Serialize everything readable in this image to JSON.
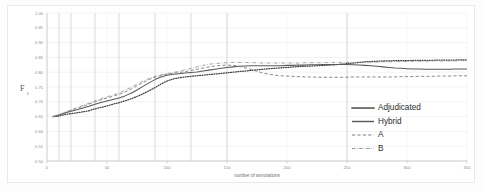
{
  "chart_data": {
    "type": "line",
    "title": "",
    "xlabel": "number of annotations",
    "ylabel": "F",
    "ylabel_sub": "1",
    "xlim": [
      0,
      350
    ],
    "ylim": [
      0.5,
      1.0
    ],
    "grid": true,
    "legend_position": "right-lower",
    "yticks": [
      "1.00",
      "0.95",
      "0.90",
      "0.85",
      "0.80",
      "0.75",
      "0.70",
      "0.65",
      "0.60",
      "0.55",
      "0.50"
    ],
    "ytick_values": [
      1.0,
      0.95,
      0.9,
      0.85,
      0.8,
      0.75,
      0.7,
      0.65,
      0.6,
      0.55,
      0.5
    ],
    "xticks": [
      "0",
      "50",
      "100",
      "150",
      "200",
      "250",
      "300",
      "350"
    ],
    "xtick_values": [
      0,
      50,
      100,
      150,
      200,
      250,
      300,
      350
    ],
    "emphasis_gridlines_x": [
      10,
      20,
      40,
      60,
      90,
      120,
      150,
      250
    ],
    "series": [
      {
        "name": "Adjudicated",
        "style": "dotted",
        "color": "#3f3f3f",
        "x": [
          5,
          10,
          15,
          20,
          25,
          30,
          35,
          40,
          45,
          50,
          55,
          60,
          65,
          70,
          75,
          80,
          85,
          90,
          95,
          100,
          105,
          110,
          115,
          120,
          125,
          130,
          135,
          140,
          145,
          150,
          155,
          160,
          165,
          170,
          175,
          180,
          185,
          190,
          195,
          200,
          205,
          210,
          215,
          220,
          225,
          230,
          235,
          240,
          245,
          250,
          255,
          260,
          265,
          270,
          275,
          280,
          285,
          290,
          295,
          300,
          305,
          310,
          315,
          320,
          325,
          330,
          335,
          340,
          345,
          350
        ],
        "values": [
          0.65,
          0.652,
          0.657,
          0.66,
          0.663,
          0.666,
          0.67,
          0.676,
          0.681,
          0.686,
          0.692,
          0.697,
          0.703,
          0.71,
          0.718,
          0.727,
          0.737,
          0.748,
          0.76,
          0.77,
          0.777,
          0.781,
          0.784,
          0.786,
          0.788,
          0.79,
          0.792,
          0.794,
          0.796,
          0.798,
          0.8,
          0.802,
          0.804,
          0.806,
          0.808,
          0.81,
          0.812,
          0.813,
          0.815,
          0.816,
          0.818,
          0.819,
          0.82,
          0.821,
          0.822,
          0.823,
          0.824,
          0.825,
          0.827,
          0.829,
          0.831,
          0.833,
          0.835,
          0.836,
          0.837,
          0.838,
          0.838,
          0.839,
          0.839,
          0.839,
          0.84,
          0.84,
          0.84,
          0.84,
          0.841,
          0.841,
          0.841,
          0.841,
          0.842,
          0.842
        ]
      },
      {
        "name": "Hybrid",
        "style": "solid",
        "color": "#5a5a5a",
        "x": [
          5,
          10,
          15,
          20,
          25,
          30,
          35,
          40,
          45,
          50,
          55,
          60,
          65,
          70,
          75,
          80,
          85,
          90,
          95,
          100,
          105,
          110,
          115,
          120,
          125,
          130,
          135,
          140,
          145,
          150,
          155,
          160,
          165,
          170,
          175,
          180,
          185,
          190,
          195,
          200,
          205,
          210,
          215,
          220,
          225,
          230,
          235,
          240,
          245,
          250,
          255,
          260,
          265,
          270,
          275,
          280,
          285,
          290,
          295,
          300,
          305,
          310,
          315,
          320,
          325,
          330,
          335,
          340,
          345,
          350
        ],
        "values": [
          0.65,
          0.655,
          0.662,
          0.668,
          0.673,
          0.679,
          0.685,
          0.692,
          0.698,
          0.703,
          0.708,
          0.713,
          0.72,
          0.729,
          0.74,
          0.752,
          0.764,
          0.775,
          0.784,
          0.79,
          0.793,
          0.795,
          0.797,
          0.799,
          0.801,
          0.804,
          0.807,
          0.81,
          0.813,
          0.816,
          0.818,
          0.82,
          0.821,
          0.822,
          0.822,
          0.822,
          0.822,
          0.822,
          0.822,
          0.823,
          0.823,
          0.824,
          0.824,
          0.825,
          0.825,
          0.826,
          0.826,
          0.826,
          0.826,
          0.826,
          0.825,
          0.824,
          0.823,
          0.822,
          0.82,
          0.818,
          0.816,
          0.814,
          0.813,
          0.812,
          0.811,
          0.811,
          0.81,
          0.81,
          0.81,
          0.81,
          0.81,
          0.811,
          0.811,
          0.811
        ]
      },
      {
        "name": "A",
        "style": "dashed",
        "color": "#7d7d7d",
        "x": [
          5,
          10,
          15,
          20,
          25,
          30,
          35,
          40,
          45,
          50,
          55,
          60,
          65,
          70,
          75,
          80,
          85,
          90,
          95,
          100,
          105,
          110,
          115,
          120,
          125,
          130,
          135,
          140,
          145,
          150,
          155,
          160,
          165,
          170,
          175,
          180,
          185,
          190,
          195,
          200,
          205,
          210,
          215,
          220,
          225,
          230,
          235,
          240,
          245,
          250,
          255,
          260,
          265,
          270,
          275,
          280,
          285,
          290,
          295,
          300,
          305,
          310,
          315,
          320,
          325,
          330,
          335,
          340,
          345,
          350
        ],
        "values": [
          0.65,
          0.656,
          0.664,
          0.671,
          0.678,
          0.685,
          0.692,
          0.7,
          0.707,
          0.713,
          0.719,
          0.725,
          0.733,
          0.743,
          0.754,
          0.765,
          0.775,
          0.783,
          0.789,
          0.793,
          0.796,
          0.799,
          0.802,
          0.806,
          0.81,
          0.814,
          0.818,
          0.821,
          0.823,
          0.824,
          0.823,
          0.82,
          0.815,
          0.809,
          0.803,
          0.797,
          0.793,
          0.79,
          0.788,
          0.787,
          0.786,
          0.785,
          0.784,
          0.784,
          0.783,
          0.783,
          0.783,
          0.783,
          0.783,
          0.783,
          0.784,
          0.784,
          0.784,
          0.784,
          0.784,
          0.784,
          0.784,
          0.784,
          0.785,
          0.785,
          0.785,
          0.786,
          0.786,
          0.786,
          0.787,
          0.787,
          0.787,
          0.788,
          0.788,
          0.788
        ]
      },
      {
        "name": "B",
        "style": "dashdot",
        "color": "#949494",
        "x": [
          5,
          10,
          15,
          20,
          25,
          30,
          35,
          40,
          45,
          50,
          55,
          60,
          65,
          70,
          75,
          80,
          85,
          90,
          95,
          100,
          105,
          110,
          115,
          120,
          125,
          130,
          135,
          140,
          145,
          150,
          155,
          160,
          165,
          170,
          175,
          180,
          185,
          190,
          195,
          200,
          205,
          210,
          215,
          220,
          225,
          230,
          235,
          240,
          245,
          250,
          255,
          260,
          265,
          270,
          275,
          280,
          285,
          290,
          295,
          300,
          305,
          310,
          315,
          320,
          325,
          330,
          335,
          340,
          345,
          350
        ],
        "values": [
          0.65,
          0.657,
          0.665,
          0.673,
          0.68,
          0.688,
          0.695,
          0.703,
          0.71,
          0.717,
          0.723,
          0.73,
          0.739,
          0.749,
          0.76,
          0.77,
          0.779,
          0.786,
          0.791,
          0.795,
          0.799,
          0.803,
          0.808,
          0.813,
          0.818,
          0.823,
          0.827,
          0.829,
          0.831,
          0.832,
          0.833,
          0.833,
          0.833,
          0.832,
          0.832,
          0.831,
          0.831,
          0.831,
          0.831,
          0.831,
          0.831,
          0.831,
          0.832,
          0.832,
          0.832,
          0.832,
          0.833,
          0.833,
          0.833,
          0.833,
          0.833,
          0.833,
          0.834,
          0.834,
          0.834,
          0.835,
          0.835,
          0.836,
          0.836,
          0.836,
          0.837,
          0.837,
          0.837,
          0.838,
          0.838,
          0.838,
          0.838,
          0.838,
          0.839,
          0.839
        ]
      }
    ],
    "legend": [
      {
        "label": "Adjudicated",
        "style": "dotted",
        "color": "#3f3f3f"
      },
      {
        "label": "Hybrid",
        "style": "solid",
        "color": "#5a5a5a"
      },
      {
        "label": "A",
        "style": "dashed",
        "color": "#7d7d7d"
      },
      {
        "label": "B",
        "style": "dashdot",
        "color": "#949494"
      }
    ]
  }
}
